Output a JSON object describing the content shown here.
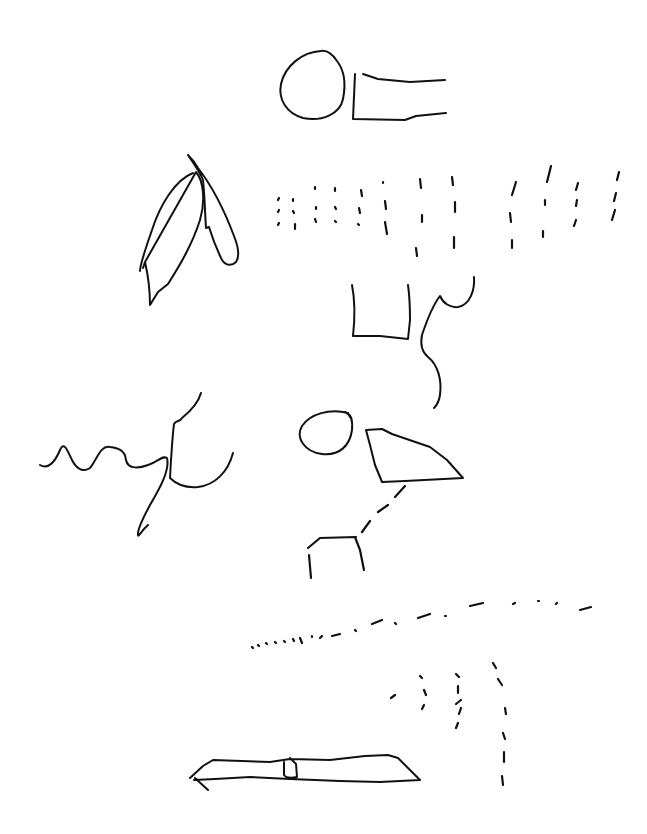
{
  "sketch": {
    "background": "#ffffff",
    "ink": "#111111",
    "shapes": [
      {
        "name": "top-circle",
        "d": "M321 51 C302 52 285 66 281 84 C278 99 286 113 303 118 C322 122 340 114 343 99 C346 84 344 70 337 61 C333 55 327 50 321 51 Z"
      },
      {
        "name": "top-bracket-rect",
        "d": "M355 74 L353 119 L405 120 L416 116 L446 113 M363 74 L378 79 L410 82 L445 80"
      },
      {
        "name": "leaf-left",
        "d": "M193 173 C175 180 160 205 152 230 C145 250 140 266 140 271 M143 268 L145 262 M145 262 C148 275 150 290 150 305 L158 292 L168 284 C180 265 192 245 200 220 C206 200 203 180 196 172 Z"
      },
      {
        "name": "leaf-right",
        "d": "M188 155 C195 165 200 172 203 180 C205 200 205 215 206 228 L209 227 C213 240 218 252 222 260 C226 266 232 266 236 262 C240 256 238 246 234 236 C225 212 212 186 198 168 C194 161 190 157 188 155"
      },
      {
        "name": "u-shape",
        "d": "M352 285 C355 300 355 318 353 336 L380 336 L408 339 L410 320 C410 305 409 292 408 285"
      },
      {
        "name": "s-curve",
        "d": "M474 277 C475 290 470 305 458 307 C450 308 443 303 440 296 C433 305 427 320 422 335 C420 345 422 352 428 357 C438 365 442 380 440 395 C439 402 436 406 434 408"
      },
      {
        "name": "squiggle",
        "d": "M40 465 C48 470 55 462 60 450 C64 440 68 452 72 460 C76 468 82 473 90 468 C97 460 100 445 110 447 C118 448 125 450 126 460 C128 470 140 468 148 465 C158 462 162 455 167 458 C170 470 160 488 150 505 C143 518 137 530 138 535 C138 538 142 530 148 525 M174 424 C176 420 180 422 182 418 C192 410 199 400 201 393 M174 424 C172 440 171 460 170 478 C176 484 186 488 198 487 C215 485 228 472 233 453"
      },
      {
        "name": "middle-circle",
        "d": "M348 413 C330 408 310 414 302 426 C295 438 305 452 322 454 C340 456 350 445 352 430 C353 420 350 414 345 412 M345 412 C350 414 352 418 352 422"
      },
      {
        "name": "quad-shape",
        "d": "M366 430 L382 429 L392 434 L430 447 L447 460 L463 478 L405 481 L382 482 L375 465 L370 445 Z"
      },
      {
        "name": "bottom-plank",
        "d": "M190 778 L203 766 L213 760 L270 762 L290 759 L330 760 L365 756 L388 755 L398 758 L410 770 L420 780 L380 782 L340 781 L290 779 L250 777 L215 779 L194 780 M195 778 L208 790 M284 762 L284 775 C286 778 292 778 297 777 L296 764 L290 758"
      }
    ],
    "dashed_groups": [
      {
        "name": "dashed-diagonal",
        "d": "M405 486 L395 497 M388 505 L378 512 M370 521 L362 532 M356 537 L320 538 L308 548 M355 537 L360 550 L364 570 M309 555 L311 578"
      },
      {
        "name": "dotted-sloped-line",
        "d": "M252 647 L253 648 M258 645 L259 646 M266 643 L267 644 M275 642 L276 643 M284 641 L285 642 M293 639 L294 641 M300 638 L302 643 M312 636 L312 637 M320 638 L322 636 M332 636 L340 634 M355 630 L356 631 M372 624 L382 620 M395 623 L396 624 M418 618 L430 614 M445 616 L446 616 M470 606 L483 603 M513 604 L515 603 M538 601 L539 601 M556 604 L557 603 M580 610 L591 607"
      },
      {
        "name": "dashed-arcs",
        "d": "M391 698 L395 695 M420 676 L422 678 M424 690 L426 695 M422 709 L424 705 M456 674 L459 677 M458 686 L458 693 M456 704 L461 700 M459 714 L461 708 M456 728 L458 723 M493 663 L496 668 M498 679 L502 685 M505 708 L506 714 M503 733 L505 739 M504 752 L504 762 M502 776 L503 785"
      },
      {
        "name": "number-grid",
        "d": "M278 200 L279 198 M278 212 L279 210 M278 225 L279 223 M293 199 L293 201 M293 211 L294 213 M295 224 L295 229 M315 187 L315 189 M316 207 L316 209 M315 219 L316 222 M335 188 L335 191 M335 207 L336 209 M335 221 L336 222 M361 190 L362 196 M359 208 L360 213 M358 224 L359 225 M383 182 L383 183 M385 201 L386 209 M385 222 L387 234 M420 179 L421 188 M422 215 L422 222 M416 248 L417 256 M452 177 L453 185 M455 202 L455 212 M454 237 L454 248 M516 182 L512 195 M510 213 L511 222 M512 240 L512 248 M551 166 L547 182 M545 200 L545 205 M543 231 L543 237 M578 183 L576 190 M577 200 L576 206 M576 220 L574 226 M619 172 L617 180 M616 193 L614 201 M615 210 L612 220"
      }
    ]
  }
}
